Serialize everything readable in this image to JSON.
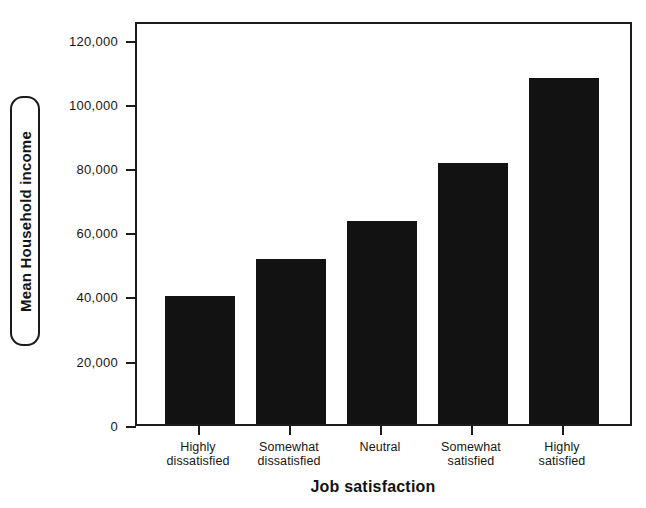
{
  "chart_data": {
    "type": "bar",
    "title": "",
    "xlabel": "Job satisfaction",
    "ylabel": "Mean Household income",
    "categories": [
      "Highly\ndissatisfied",
      "Somewhat\ndissatisfied",
      "Neutral",
      "Somewhat\nsatisfied",
      "Highly\nsatisfied"
    ],
    "values": [
      40000,
      51500,
      63500,
      81700,
      108000
    ],
    "ylim": [
      0,
      125000
    ],
    "yticks": [
      0,
      20000,
      40000,
      60000,
      80000,
      100000,
      120000
    ],
    "ytick_labels": [
      "0",
      "20,000",
      "40,000",
      "60,000",
      "80,000",
      "100,000",
      "120,000"
    ],
    "grid": false,
    "legend": false,
    "bar_color": "#121212",
    "axis_color": "#1c1c1c",
    "background": "#ffffff"
  },
  "axes": {
    "y_title_label": "Mean Household income",
    "y_title_selected": true,
    "x_title_label": "Job satisfaction"
  },
  "x_labels": [
    {
      "line1": "Highly",
      "line2": "dissatisfied"
    },
    {
      "line1": "Somewhat",
      "line2": "dissatisfied"
    },
    {
      "line1": "Neutral",
      "line2": ""
    },
    {
      "line1": "Somewhat",
      "line2": "satisfied"
    },
    {
      "line1": "Highly",
      "line2": "satisfied"
    }
  ]
}
